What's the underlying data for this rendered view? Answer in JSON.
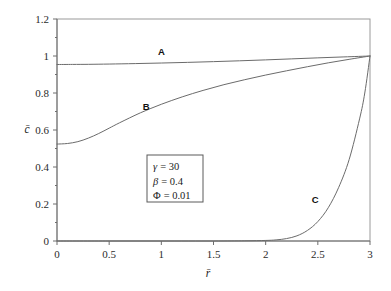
{
  "chart_data": {
    "type": "line",
    "title": "",
    "xlabel": "r̄",
    "ylabel": "c̄",
    "xlim": [
      0,
      3
    ],
    "ylim": [
      0,
      1.2
    ],
    "grid": false,
    "legend_position": "inline-curve-labels",
    "xticks": [
      "0",
      "0.5",
      "1",
      "1.5",
      "2",
      "2.5",
      "3"
    ],
    "xtick_values": [
      0,
      0.5,
      1,
      1.5,
      2,
      2.5,
      3
    ],
    "yticks": [
      "0",
      "0.2",
      "0.4",
      "0.6",
      "0.8",
      "1",
      "1.2"
    ],
    "ytick_values": [
      0,
      0.2,
      0.4,
      0.6,
      0.8,
      1.0,
      1.2
    ],
    "series": [
      {
        "name": "A",
        "label": "A",
        "label_x": 1.0,
        "label_y": 1.008,
        "x": [
          0,
          0.15,
          0.3,
          0.5,
          0.75,
          1.0,
          1.25,
          1.5,
          1.75,
          2.0,
          2.25,
          2.5,
          2.75,
          3.0
        ],
        "values": [
          0.954,
          0.9545,
          0.955,
          0.9565,
          0.959,
          0.962,
          0.9655,
          0.9695,
          0.974,
          0.979,
          0.9845,
          0.99,
          0.995,
          1.0
        ]
      },
      {
        "name": "B",
        "label": "B",
        "label_x": 0.855,
        "label_y": 0.706,
        "x": [
          0,
          0.1,
          0.2,
          0.3,
          0.4,
          0.5,
          0.6,
          0.8,
          1.0,
          1.2,
          1.4,
          1.6,
          1.8,
          2.0,
          2.2,
          2.4,
          2.6,
          2.8,
          3.0
        ],
        "values": [
          0.524,
          0.527,
          0.537,
          0.556,
          0.581,
          0.61,
          0.639,
          0.693,
          0.739,
          0.779,
          0.814,
          0.845,
          0.872,
          0.897,
          0.92,
          0.942,
          0.963,
          0.982,
          1.0
        ]
      },
      {
        "name": "C",
        "label": "C",
        "label_x": 2.475,
        "label_y": 0.205,
        "x": [
          0,
          0.5,
          1.0,
          1.5,
          1.8,
          2.0,
          2.1,
          2.2,
          2.3,
          2.4,
          2.5,
          2.6,
          2.7,
          2.8,
          2.9,
          2.95,
          3.0
        ],
        "values": [
          0.0,
          0.0,
          0.0,
          0.0,
          0.001,
          0.003,
          0.006,
          0.013,
          0.028,
          0.057,
          0.105,
          0.18,
          0.29,
          0.44,
          0.66,
          0.8,
          1.0
        ]
      }
    ],
    "annotations": [
      {
        "symbol": "γ",
        "operator": "=",
        "value": "30"
      },
      {
        "symbol": "β",
        "operator": "=",
        "value": "0.4"
      },
      {
        "symbol": "Φ",
        "operator": "=",
        "value": "0.01"
      }
    ]
  },
  "colors": {
    "curve": "#6b6b6b",
    "axis": "#6e6e6e",
    "frame": "#9a9a9a",
    "text": "#1a1a1a",
    "box_border": "#5a5a5a",
    "background": "#ffffff"
  }
}
